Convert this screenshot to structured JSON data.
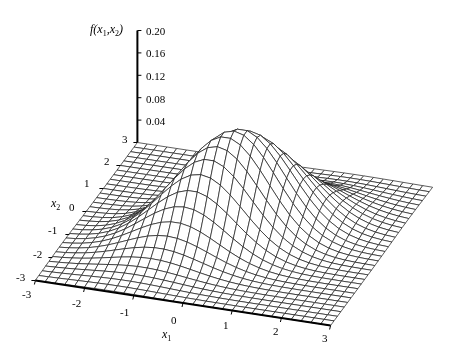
{
  "chart_data": {
    "type": "surface3d",
    "title": "",
    "function": "bivariate_normal",
    "params": {
      "mu1": 0,
      "mu2": 0,
      "sigma1": 1,
      "sigma2": 1,
      "rho": 0.5
    },
    "zlabel": "f(x1,x2)",
    "zlabel_parts": {
      "f": "f",
      "x1": "x",
      "x1_sub": "1",
      "x2": "x",
      "x2_sub": "2"
    },
    "xlabel": "x1",
    "xlabel_parts": {
      "var": "x",
      "sub": "1"
    },
    "ylabel": "x2",
    "ylabel_parts": {
      "var": "x",
      "sub": "2"
    },
    "x1_range": [
      -3,
      3
    ],
    "x2_range": [
      -3,
      3
    ],
    "z_range": [
      0,
      0.2
    ],
    "grid_step": 0.2,
    "x1_ticks": [
      "-3",
      "-2",
      "-1",
      "0",
      "1",
      "2",
      "3"
    ],
    "x2_ticks": [
      "-3",
      "-2",
      "-1",
      "0",
      "1",
      "2",
      "3"
    ],
    "z_ticks": [
      "0.04",
      "0.08",
      "0.12",
      "0.16",
      "0.20"
    ],
    "peak_value": 0.1838,
    "grid": true,
    "legend": null
  },
  "projection": {
    "origin_screen": [
      234,
      234
    ],
    "x1_unit": [
      49.2,
      7.5
    ],
    "x2_unit": [
      17.0,
      -23.0
    ],
    "z_unit_px": 560
  },
  "colors": {
    "mesh": "#1a1a1a",
    "fill": "#ffffff",
    "axis": "#000000"
  }
}
